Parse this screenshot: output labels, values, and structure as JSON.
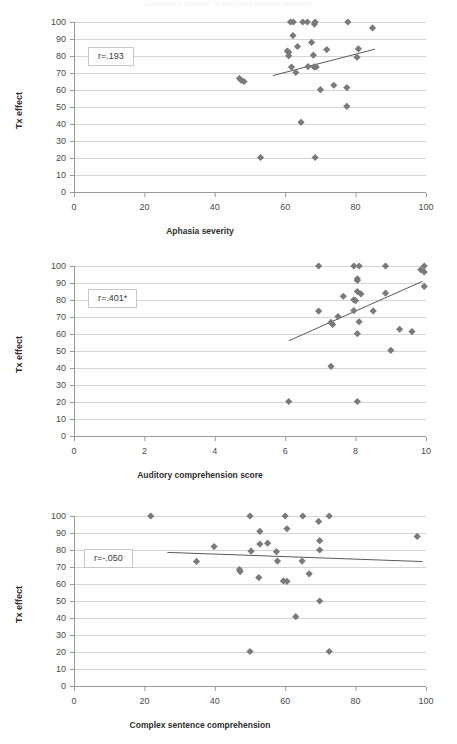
{
  "figure": {
    "title_faint": "Correlations between Tx effect and baseline measures",
    "marker_color": "#7a7a7a",
    "gridline_color": "#d4d4d4",
    "axis_color": "#9a9a9a",
    "trendline_color": "#5a5a5a"
  },
  "chart_data": [
    {
      "type": "scatter",
      "id": "aphasia-severity",
      "title": "",
      "xlabel": "Aphasia severity",
      "ylabel": "Tx effect",
      "xlim": [
        0,
        100
      ],
      "ylim": [
        0,
        100
      ],
      "xticks": [
        0,
        20,
        40,
        60,
        80,
        100
      ],
      "yticks": [
        0,
        10,
        20,
        30,
        40,
        50,
        60,
        70,
        80,
        90,
        100
      ],
      "grid": true,
      "annotation": "r=.193",
      "legend": "none",
      "trendline": {
        "x0": 56.5,
        "y0": 68.5,
        "x1": 85.5,
        "y1": 84.0
      },
      "points": [
        [
          53.0,
          20.3
        ],
        [
          68.5,
          20.3
        ],
        [
          64.5,
          41.0
        ],
        [
          77.5,
          50.4
        ],
        [
          70.0,
          60.2
        ],
        [
          73.8,
          62.8
        ],
        [
          77.5,
          61.4
        ],
        [
          47.0,
          66.8
        ],
        [
          47.6,
          65.6
        ],
        [
          48.3,
          65.0
        ],
        [
          63.0,
          70.3
        ],
        [
          61.8,
          73.5
        ],
        [
          66.5,
          73.8
        ],
        [
          68.2,
          73.6
        ],
        [
          68.8,
          73.6
        ],
        [
          61.0,
          80.1
        ],
        [
          68.0,
          80.5
        ],
        [
          80.4,
          79.3
        ],
        [
          61.0,
          82.2
        ],
        [
          60.6,
          82.9
        ],
        [
          80.8,
          84.2
        ],
        [
          63.5,
          85.6
        ],
        [
          67.5,
          88.0
        ],
        [
          71.8,
          83.8
        ],
        [
          62.2,
          92.0
        ],
        [
          84.8,
          96.5
        ],
        [
          68.3,
          98.8
        ],
        [
          61.5,
          100.0
        ],
        [
          62.3,
          100.0
        ],
        [
          65.0,
          100.0
        ],
        [
          66.3,
          100.0
        ],
        [
          68.5,
          100.0
        ],
        [
          77.8,
          100.0
        ]
      ]
    },
    {
      "type": "scatter",
      "id": "auditory-comprehension",
      "title": "",
      "xlabel": "Auditory comprehension score",
      "ylabel": "Tx effect",
      "xlim": [
        0,
        10
      ],
      "ylim": [
        0,
        100
      ],
      "xticks": [
        0,
        2,
        4,
        6,
        8,
        10
      ],
      "yticks": [
        0,
        10,
        20,
        30,
        40,
        50,
        60,
        70,
        80,
        90,
        100
      ],
      "grid": true,
      "annotation": "r=.401*",
      "legend": "none",
      "trendline": {
        "x0": 6.1,
        "y0": 56.0,
        "x1": 9.9,
        "y1": 91.0
      },
      "points": [
        [
          6.1,
          20.3
        ],
        [
          8.05,
          20.3
        ],
        [
          7.3,
          41.0
        ],
        [
          9.0,
          50.4
        ],
        [
          8.05,
          60.2
        ],
        [
          9.25,
          62.8
        ],
        [
          9.6,
          61.4
        ],
        [
          7.3,
          66.8
        ],
        [
          7.35,
          65.6
        ],
        [
          8.1,
          67.2
        ],
        [
          7.5,
          70.3
        ],
        [
          6.95,
          73.5
        ],
        [
          7.95,
          73.8
        ],
        [
          8.5,
          73.6
        ],
        [
          7.95,
          80.1
        ],
        [
          8.0,
          79.6
        ],
        [
          8.15,
          83.6
        ],
        [
          7.65,
          82.2
        ],
        [
          8.05,
          85.0
        ],
        [
          8.85,
          84.0
        ],
        [
          9.95,
          88.0
        ],
        [
          8.05,
          91.5
        ],
        [
          8.05,
          92.5
        ],
        [
          9.85,
          97.8
        ],
        [
          9.95,
          96.5
        ],
        [
          6.95,
          100.0
        ],
        [
          7.95,
          100.0
        ],
        [
          8.1,
          100.0
        ],
        [
          8.85,
          100.0
        ],
        [
          9.95,
          100.0
        ]
      ]
    },
    {
      "type": "scatter",
      "id": "complex-sentence-comprehension",
      "title": "",
      "xlabel": "Complex sentence comprehension",
      "ylabel": "Tx effect",
      "xlim": [
        0,
        100
      ],
      "ylim": [
        0,
        100
      ],
      "xticks": [
        0,
        20,
        40,
        60,
        80,
        100
      ],
      "yticks": [
        0,
        10,
        20,
        30,
        40,
        50,
        60,
        70,
        80,
        90,
        100
      ],
      "grid": true,
      "annotation": "r=-.050",
      "legend": "none",
      "trendline": {
        "x0": 26.5,
        "y0": 78.6,
        "x1": 99.0,
        "y1": 73.2
      },
      "points": [
        [
          50.0,
          20.3
        ],
        [
          72.5,
          20.3
        ],
        [
          63.0,
          40.8
        ],
        [
          69.8,
          50.0
        ],
        [
          52.5,
          63.8
        ],
        [
          59.5,
          61.8
        ],
        [
          60.5,
          61.6
        ],
        [
          47.0,
          68.5
        ],
        [
          47.2,
          67.3
        ],
        [
          66.8,
          66.0
        ],
        [
          57.8,
          73.5
        ],
        [
          34.8,
          73.3
        ],
        [
          64.8,
          73.5
        ],
        [
          50.3,
          79.3
        ],
        [
          57.5,
          79.0
        ],
        [
          69.8,
          80.0
        ],
        [
          52.8,
          83.5
        ],
        [
          55.0,
          84.0
        ],
        [
          39.8,
          82.0
        ],
        [
          69.8,
          85.5
        ],
        [
          97.5,
          88.0
        ],
        [
          52.8,
          91.0
        ],
        [
          60.5,
          92.5
        ],
        [
          69.5,
          96.8
        ],
        [
          21.8,
          100.0
        ],
        [
          50.0,
          100.0
        ],
        [
          60.0,
          100.0
        ],
        [
          65.0,
          100.0
        ],
        [
          72.5,
          100.0
        ]
      ]
    }
  ]
}
